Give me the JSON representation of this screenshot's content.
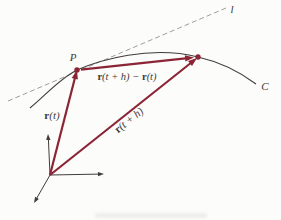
{
  "figure": {
    "labels": {
      "tangent_line": "l",
      "curve": "C",
      "point": "P",
      "r_t": {
        "vec": "r",
        "arg": "(t)"
      },
      "r_th": {
        "vec": "r",
        "arg": "(t + h)"
      },
      "secant": {
        "vec1": "r",
        "arg1": "(t + h) − ",
        "vec2": "r",
        "arg2": "(t)"
      }
    },
    "colors": {
      "vector": "#8b2535",
      "line": "#413d39",
      "dashed": "#97928b",
      "text": "#3e3a36",
      "background": "#fcfcfb"
    }
  }
}
